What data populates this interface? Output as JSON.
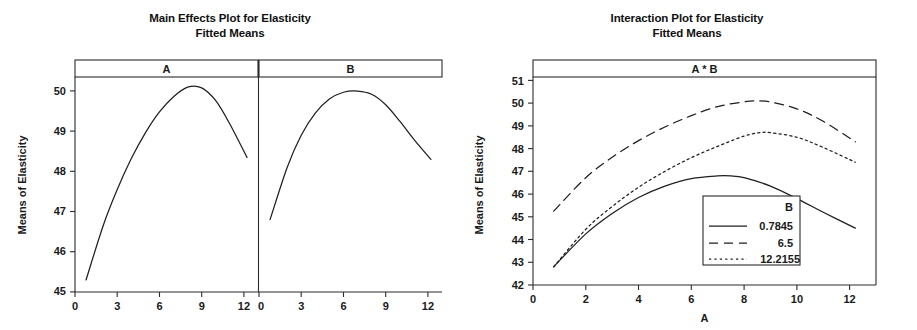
{
  "main_effects": {
    "title_line1": "Main Effects Plot for Elasticity",
    "title_line2": "Fitted Means",
    "ylabel": "Means of Elasticity",
    "panels": [
      {
        "header": "A"
      },
      {
        "header": "B"
      }
    ],
    "ytick_labels": [
      "50",
      "49",
      "48",
      "47",
      "46",
      "45"
    ],
    "xtick_labels_a": [
      "0",
      "3",
      "6",
      "9",
      "12"
    ],
    "xtick_labels_b": [
      "0",
      "3",
      "6",
      "9",
      "12"
    ]
  },
  "interaction": {
    "title_line1": "Interaction Plot for Elasticity",
    "title_line2": "Fitted Means",
    "panel_header": "A * B",
    "ylabel": "Means of Elasticity",
    "xlabel": "A",
    "ytick_labels": [
      "51",
      "50",
      "49",
      "48",
      "47",
      "46",
      "45",
      "44",
      "43",
      "42"
    ],
    "xtick_labels": [
      "0",
      "2",
      "4",
      "6",
      "8",
      "10",
      "12"
    ],
    "legend": {
      "title": "B",
      "entries": [
        {
          "label": "0.7845",
          "style": "solid"
        },
        {
          "label": "6.5",
          "style": "dashed"
        },
        {
          "label": "12.2155",
          "style": "dotted"
        }
      ]
    }
  },
  "chart_data": [
    {
      "type": "line",
      "title": "Main Effects Plot for Elasticity\nFitted Means",
      "panel": "A",
      "xlabel": "",
      "ylabel": "Means of Elasticity",
      "xlim": [
        0,
        13
      ],
      "ylim": [
        45,
        50.35
      ],
      "xticks": [
        0,
        3,
        6,
        9,
        12
      ],
      "yticks": [
        45,
        46,
        47,
        48,
        49,
        50
      ],
      "grid": false,
      "legend": "none",
      "series": [
        {
          "name": "A main effect",
          "x": [
            0.7845,
            2,
            3,
            4,
            5,
            6,
            7,
            8,
            9,
            10,
            11,
            12.2155
          ],
          "y": [
            45.3,
            46.65,
            47.55,
            48.32,
            48.96,
            49.48,
            49.86,
            50.1,
            50.08,
            49.76,
            49.18,
            48.35
          ]
        }
      ]
    },
    {
      "type": "line",
      "title": "Main Effects Plot for Elasticity\nFitted Means",
      "panel": "B",
      "xlabel": "",
      "ylabel": "Means of Elasticity",
      "xlim": [
        0,
        13
      ],
      "ylim": [
        45,
        50.35
      ],
      "xticks": [
        0,
        3,
        6,
        9,
        12
      ],
      "yticks": [
        45,
        46,
        47,
        48,
        49,
        50
      ],
      "grid": false,
      "legend": "none",
      "series": [
        {
          "name": "B main effect",
          "x": [
            0.7845,
            2,
            3,
            4,
            5,
            6,
            7,
            8,
            9,
            10,
            11,
            12.2155
          ],
          "y": [
            46.8,
            48.1,
            48.9,
            49.45,
            49.8,
            49.97,
            50.0,
            49.92,
            49.66,
            49.25,
            48.8,
            48.3
          ]
        }
      ]
    },
    {
      "type": "line",
      "title": "Interaction Plot for Elasticity\nFitted Means",
      "panel": "A * B",
      "xlabel": "A",
      "ylabel": "Means of Elasticity",
      "xlim": [
        0,
        13
      ],
      "ylim": [
        42,
        51.15
      ],
      "xticks": [
        0,
        2,
        4,
        6,
        8,
        10,
        12
      ],
      "yticks": [
        42,
        43,
        44,
        45,
        46,
        47,
        48,
        49,
        50,
        51
      ],
      "grid": false,
      "legend": "inside-lower-right",
      "legend_title": "B",
      "series": [
        {
          "name": "0.7845",
          "style": "solid",
          "x": [
            0.7845,
            2,
            3,
            4,
            5,
            6,
            7,
            7.5,
            8,
            9,
            10,
            11,
            12.2155
          ],
          "y": [
            42.8,
            44.25,
            45.15,
            45.85,
            46.35,
            46.68,
            46.8,
            46.8,
            46.72,
            46.35,
            45.8,
            45.2,
            44.5
          ]
        },
        {
          "name": "6.5",
          "style": "dashed",
          "x": [
            0.7845,
            2,
            3,
            4,
            5,
            6,
            7,
            8,
            8.4,
            9,
            10,
            11,
            12.2155
          ],
          "y": [
            45.25,
            46.72,
            47.62,
            48.35,
            48.95,
            49.45,
            49.85,
            50.06,
            50.1,
            50.05,
            49.75,
            49.2,
            48.3
          ]
        },
        {
          "name": "12.2155",
          "style": "dotted",
          "x": [
            0.7845,
            2,
            3,
            4,
            5,
            6,
            7,
            8,
            8.6,
            9,
            10,
            11,
            12.2155
          ],
          "y": [
            42.8,
            44.45,
            45.45,
            46.3,
            47.0,
            47.6,
            48.1,
            48.55,
            48.7,
            48.7,
            48.5,
            48.05,
            47.4
          ]
        }
      ]
    }
  ]
}
